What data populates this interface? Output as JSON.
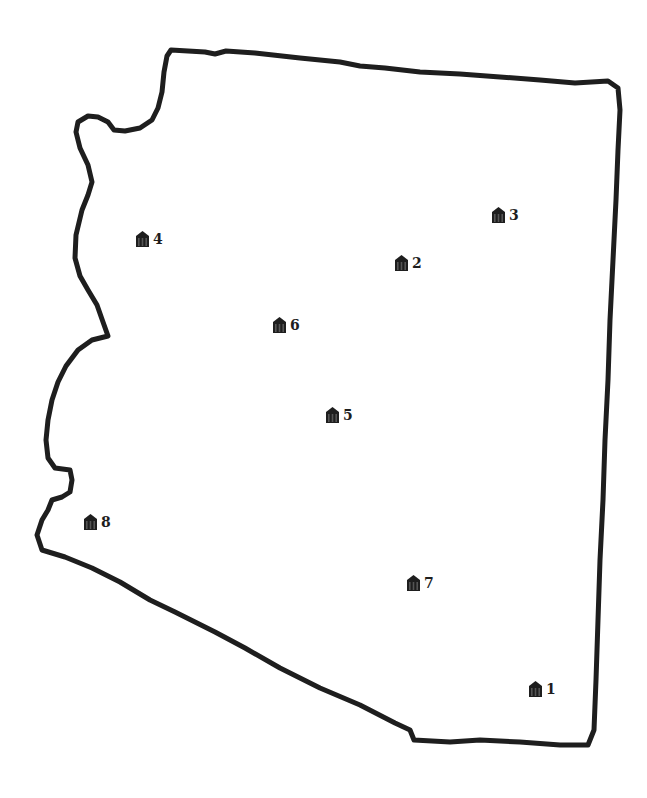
{
  "map": {
    "region_shape": "state-outline",
    "outline_color": "#1e1e1e",
    "background_color": "#ffffff",
    "markers": [
      {
        "id": "1",
        "label": "1",
        "icon": "building-icon",
        "x": 536,
        "y": 690
      },
      {
        "id": "2",
        "label": "2",
        "icon": "building-icon",
        "x": 402,
        "y": 264
      },
      {
        "id": "3",
        "label": "3",
        "icon": "building-icon",
        "x": 499,
        "y": 216
      },
      {
        "id": "4",
        "label": "4",
        "icon": "building-icon",
        "x": 143,
        "y": 240
      },
      {
        "id": "5",
        "label": "5",
        "icon": "building-icon",
        "x": 333,
        "y": 416
      },
      {
        "id": "6",
        "label": "6",
        "icon": "building-icon",
        "x": 280,
        "y": 326
      },
      {
        "id": "7",
        "label": "7",
        "icon": "building-icon",
        "x": 414,
        "y": 584
      },
      {
        "id": "8",
        "label": "8",
        "icon": "building-icon",
        "x": 91,
        "y": 523
      }
    ]
  }
}
